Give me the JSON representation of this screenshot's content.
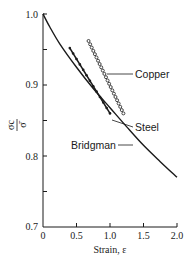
{
  "chart_data": {
    "type": "line",
    "title": "",
    "xlabel": "Strain, ε",
    "ylabel": "σc/σ̄",
    "xlim": [
      0,
      2.0
    ],
    "ylim": [
      0.7,
      1.0
    ],
    "grid": false,
    "legend_position": "inline labels with leader lines",
    "x_ticks": [
      0,
      0.5,
      1.0,
      1.5,
      2.0
    ],
    "x_tick_labels": [
      "0",
      "0.5",
      "1.0",
      "1.5",
      "2.0"
    ],
    "y_ticks": [
      0.7,
      0.75,
      0.8,
      0.85,
      0.9,
      0.95,
      1.0
    ],
    "y_tick_labels": [
      "0.7",
      "",
      "0.8",
      "",
      "0.9",
      "",
      "1.0"
    ],
    "series": [
      {
        "name": "Bridgman",
        "style": "solid curve",
        "x": [
          0,
          0.1,
          0.25,
          0.5,
          0.75,
          1.0,
          1.25,
          1.5,
          1.75,
          2.0
        ],
        "y": [
          1.0,
          0.982,
          0.958,
          0.925,
          0.895,
          0.868,
          0.841,
          0.815,
          0.792,
          0.77
        ]
      },
      {
        "name": "Steel",
        "style": "solid line with filled dots",
        "x": [
          0.4,
          0.55,
          0.7,
          0.85,
          1.0
        ],
        "y": [
          0.952,
          0.928,
          0.905,
          0.882,
          0.86
        ]
      },
      {
        "name": "Copper",
        "style": "open circle markers",
        "x": [
          0.68,
          0.8,
          0.93,
          1.06,
          1.2
        ],
        "y": [
          0.962,
          0.94,
          0.915,
          0.888,
          0.86
        ]
      }
    ],
    "annotations": [
      {
        "text": "Copper",
        "points_to": "Copper series near ε≈0.95"
      },
      {
        "text": "Steel",
        "points_to": "Steel series near ε≈1.0"
      },
      {
        "text": "Bridgman",
        "points_to": "Bridgman curve near ε≈1.25"
      }
    ]
  },
  "labels": {
    "copper": "Copper",
    "steel": "Steel",
    "bridgman": "Bridgman",
    "xlabel": "Strain, ε",
    "ylabel_num": "σc",
    "ylabel_den": "σ̄"
  },
  "ticks": {
    "x": [
      "0",
      "0.5",
      "1.0",
      "1.5",
      "2.0"
    ],
    "y": [
      "0.7",
      "0.8",
      "0.9",
      "1.0"
    ]
  }
}
